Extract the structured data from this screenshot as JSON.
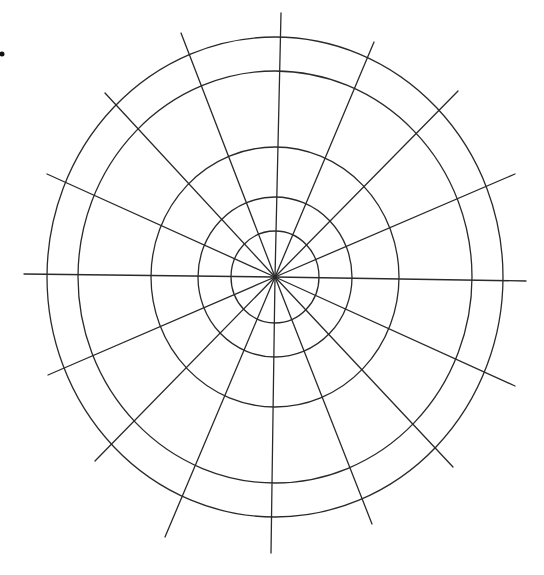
{
  "diagram": {
    "type": "polar-grid",
    "canvas": {
      "width": 544,
      "height": 575
    },
    "center": {
      "x": 275,
      "y": 277
    },
    "line_color": "#2a2a2a",
    "rings": [
      {
        "rx": 44,
        "ry": 46
      },
      {
        "rx": 77,
        "ry": 80
      },
      {
        "rx": 124,
        "ry": 130
      },
      {
        "rx": 197,
        "ry": 206
      },
      {
        "rx": 228,
        "ry": 240
      }
    ],
    "spokes": [
      {
        "x": 281,
        "y": 13
      },
      {
        "x": 374,
        "y": 42
      },
      {
        "x": 458,
        "y": 91
      },
      {
        "x": 515,
        "y": 174
      },
      {
        "x": 526,
        "y": 281
      },
      {
        "x": 515,
        "y": 386
      },
      {
        "x": 453,
        "y": 467
      },
      {
        "x": 372,
        "y": 524
      },
      {
        "x": 271,
        "y": 553
      },
      {
        "x": 165,
        "y": 537
      },
      {
        "x": 95,
        "y": 461
      },
      {
        "x": 48,
        "y": 375
      },
      {
        "x": 24,
        "y": 274
      },
      {
        "x": 47,
        "y": 174
      },
      {
        "x": 105,
        "y": 93
      },
      {
        "x": 181,
        "y": 33
      }
    ],
    "marker_dot": {
      "x": 2,
      "y": 54,
      "r": 2.5
    }
  }
}
